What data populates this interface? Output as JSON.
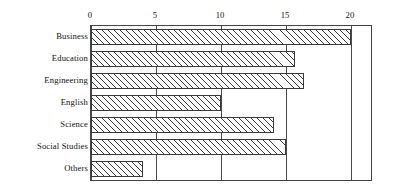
{
  "chart_data": {
    "type": "bar",
    "orientation": "horizontal",
    "title": "",
    "subtitle": "",
    "xlabel": "",
    "ylabel": "",
    "categories": [
      "Business",
      "Education",
      "Engineering",
      "English",
      "Science",
      "Social Studies",
      "Others"
    ],
    "values": [
      20,
      15.7,
      16.4,
      10,
      14.1,
      15,
      4
    ],
    "xlim": [
      0,
      21.7
    ],
    "xticks": [
      0,
      5,
      10,
      15,
      20
    ],
    "xtick_labels": [
      "0",
      "5",
      "10",
      "15",
      "20"
    ],
    "grid": true,
    "grid_axis": "x",
    "legend": null,
    "series": [
      {
        "name": "",
        "values": [
          20,
          15.7,
          16.4,
          10,
          14.1,
          15,
          4
        ],
        "fill": "hatched-diagonal",
        "edge_color": "#3a3a3a",
        "fill_color": "#ffffff"
      }
    ],
    "annotations": [],
    "colors": {
      "background": "#ffffff",
      "frame": "#444444",
      "gridline": "#4a4a4a",
      "bar_edge": "#3a3a3a",
      "bar_hatch": "#3a3a3a",
      "text": "#111111"
    }
  },
  "axis": {
    "ticks": [
      {
        "label": "0",
        "value": 0
      },
      {
        "label": "5",
        "value": 5
      },
      {
        "label": "10",
        "value": 10
      },
      {
        "label": "15",
        "value": 15
      },
      {
        "label": "20",
        "value": 20
      }
    ]
  },
  "categories": [
    {
      "label": "Business",
      "value": 20
    },
    {
      "label": "Education",
      "value": 15.7
    },
    {
      "label": "Engineering",
      "value": 16.4
    },
    {
      "label": "English",
      "value": 10
    },
    {
      "label": "Science",
      "value": 14.1
    },
    {
      "label": "Social Studies",
      "value": 15
    },
    {
      "label": "Others",
      "value": 4
    }
  ]
}
